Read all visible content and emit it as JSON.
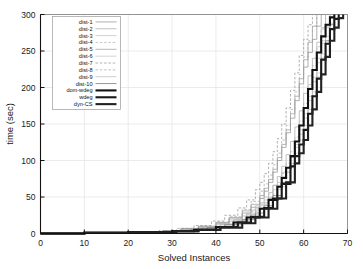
{
  "chart_data": {
    "type": "line",
    "title": "",
    "subtitle": "",
    "xlabel": "Solved Instances",
    "ylabel": "time (sec)",
    "xlim": [
      0,
      70
    ],
    "ylim": [
      0,
      300
    ],
    "xticks": [
      0,
      10,
      20,
      30,
      40,
      50,
      60,
      70
    ],
    "yticks": [
      0,
      50,
      100,
      150,
      200,
      250,
      300
    ],
    "grid": true,
    "legend_position": "upper-left-inside",
    "legend_entries": [
      {
        "label": "dist-1",
        "style": "solid",
        "width": 0.7,
        "color": "#8c8c8c"
      },
      {
        "label": "dist-2",
        "style": "solid",
        "width": 0.7,
        "color": "#a8a8a8"
      },
      {
        "label": "dist-3",
        "style": "solid",
        "width": 0.7,
        "color": "#bdbdbd"
      },
      {
        "label": "dist-4",
        "style": "dashed",
        "width": 0.7,
        "color": "#b0b0b0"
      },
      {
        "label": "dist-5",
        "style": "solid",
        "width": 0.7,
        "color": "#9a9a9a"
      },
      {
        "label": "dist-6",
        "style": "solid",
        "width": 0.7,
        "color": "#c2c2c2"
      },
      {
        "label": "dist-7",
        "style": "dashed",
        "width": 0.7,
        "color": "#8f8f8f"
      },
      {
        "label": "dist-8",
        "style": "dashed",
        "width": 0.7,
        "color": "#a5a5a5"
      },
      {
        "label": "dist-9",
        "style": "solid",
        "width": 0.7,
        "color": "#b8b8b8"
      },
      {
        "label": "dist-10",
        "style": "solid",
        "width": 0.8,
        "color": "#7d7d7d"
      },
      {
        "label": "dom-wdeg",
        "style": "solid",
        "width": 2.1,
        "color": "#111111"
      },
      {
        "label": "wdeg",
        "style": "solid",
        "width": 2.1,
        "color": "#1a1a1a"
      },
      {
        "label": "dyn-CS",
        "style": "solid",
        "width": 2.1,
        "color": "#222222"
      }
    ],
    "series": [
      {
        "name": "dist-1",
        "x": [
          0,
          10,
          20,
          28,
          32,
          36,
          40,
          43,
          46,
          48,
          50,
          51,
          52,
          53,
          54,
          55,
          56,
          57,
          58,
          59,
          60,
          61,
          62,
          63,
          64
        ],
        "y": [
          0,
          1,
          2,
          4,
          6,
          9,
          14,
          20,
          28,
          36,
          48,
          58,
          70,
          84,
          100,
          118,
          138,
          158,
          182,
          205,
          228,
          248,
          266,
          284,
          300
        ]
      },
      {
        "name": "dist-2",
        "x": [
          0,
          10,
          20,
          28,
          32,
          36,
          40,
          43,
          46,
          48,
          50,
          52,
          53,
          54,
          55,
          56,
          57,
          58,
          59,
          60,
          61,
          62,
          63,
          64,
          65
        ],
        "y": [
          0,
          1,
          2,
          4,
          6,
          8,
          12,
          17,
          24,
          32,
          42,
          56,
          66,
          78,
          92,
          108,
          126,
          146,
          168,
          192,
          216,
          240,
          262,
          282,
          300
        ]
      },
      {
        "name": "dist-3",
        "x": [
          0,
          10,
          20,
          28,
          33,
          37,
          41,
          44,
          47,
          49,
          51,
          53,
          55,
          56,
          57,
          58,
          59,
          60,
          61,
          62,
          63,
          64,
          65,
          66
        ],
        "y": [
          0,
          1,
          2,
          3,
          5,
          8,
          12,
          18,
          26,
          34,
          46,
          60,
          78,
          90,
          104,
          122,
          142,
          164,
          188,
          214,
          240,
          264,
          284,
          300
        ]
      },
      {
        "name": "dist-4",
        "x": [
          0,
          10,
          20,
          29,
          33,
          37,
          41,
          45,
          48,
          50,
          52,
          54,
          55,
          56,
          57,
          58,
          59,
          60,
          61,
          62,
          63,
          64,
          65
        ],
        "y": [
          0,
          1,
          2,
          4,
          6,
          9,
          14,
          21,
          30,
          40,
          54,
          70,
          82,
          96,
          112,
          132,
          154,
          178,
          204,
          230,
          256,
          280,
          300
        ]
      },
      {
        "name": "dist-5",
        "x": [
          0,
          10,
          20,
          28,
          32,
          36,
          40,
          43,
          46,
          48,
          50,
          51,
          52,
          53,
          54,
          55,
          56,
          57,
          58,
          59,
          60,
          61,
          62,
          63
        ],
        "y": [
          0,
          1,
          2,
          4,
          7,
          10,
          15,
          22,
          31,
          40,
          52,
          62,
          74,
          88,
          104,
          122,
          142,
          164,
          188,
          212,
          238,
          262,
          284,
          300
        ]
      },
      {
        "name": "dist-6",
        "x": [
          0,
          10,
          20,
          29,
          34,
          38,
          42,
          45,
          48,
          50,
          52,
          54,
          56,
          57,
          58,
          59,
          60,
          61,
          62,
          63,
          64,
          65,
          66,
          67
        ],
        "y": [
          0,
          1,
          2,
          3,
          5,
          8,
          12,
          18,
          26,
          35,
          48,
          64,
          84,
          96,
          110,
          128,
          148,
          170,
          194,
          220,
          246,
          270,
          288,
          300
        ]
      },
      {
        "name": "dist-7",
        "x": [
          0,
          10,
          20,
          27,
          31,
          35,
          39,
          42,
          45,
          47,
          49,
          50,
          51,
          52,
          53,
          54,
          55,
          56,
          57,
          58,
          59,
          60,
          61,
          62
        ],
        "y": [
          0,
          1,
          2,
          4,
          7,
          11,
          17,
          25,
          35,
          46,
          60,
          70,
          82,
          96,
          112,
          130,
          150,
          172,
          196,
          220,
          244,
          266,
          286,
          300
        ]
      },
      {
        "name": "dist-8",
        "x": [
          0,
          10,
          20,
          28,
          32,
          36,
          40,
          43,
          46,
          48,
          50,
          51,
          52,
          53,
          54,
          55,
          56,
          57,
          58,
          59,
          60,
          61,
          62,
          63
        ],
        "y": [
          0,
          1,
          2,
          4,
          6,
          10,
          16,
          23,
          33,
          44,
          58,
          68,
          80,
          94,
          110,
          128,
          148,
          170,
          194,
          218,
          242,
          264,
          284,
          300
        ]
      },
      {
        "name": "dist-9",
        "x": [
          0,
          10,
          20,
          29,
          33,
          37,
          41,
          44,
          47,
          49,
          51,
          53,
          55,
          57,
          58,
          59,
          60,
          61,
          62,
          63,
          64,
          65,
          66
        ],
        "y": [
          0,
          1,
          2,
          3,
          5,
          8,
          13,
          19,
          28,
          38,
          50,
          66,
          84,
          104,
          118,
          136,
          158,
          182,
          208,
          234,
          260,
          282,
          300
        ]
      },
      {
        "name": "dist-10",
        "x": [
          0,
          10,
          20,
          30,
          34,
          38,
          42,
          46,
          49,
          51,
          53,
          55,
          57,
          58,
          59,
          60,
          61,
          62,
          63,
          64,
          65,
          66,
          67
        ],
        "y": [
          0,
          1,
          2,
          3,
          5,
          8,
          12,
          19,
          28,
          38,
          52,
          70,
          92,
          106,
          122,
          142,
          164,
          188,
          214,
          240,
          264,
          286,
          300
        ]
      },
      {
        "name": "dom-wdeg",
        "x": [
          0,
          10,
          20,
          30,
          35,
          40,
          44,
          47,
          50,
          52,
          54,
          55,
          56,
          57,
          58,
          59,
          60,
          61,
          62,
          63,
          64,
          65,
          66,
          67
        ],
        "y": [
          0,
          1,
          2,
          3,
          5,
          9,
          15,
          22,
          34,
          46,
          64,
          76,
          90,
          106,
          126,
          148,
          172,
          198,
          224,
          248,
          270,
          286,
          296,
          300
        ]
      },
      {
        "name": "wdeg",
        "x": [
          0,
          10,
          20,
          30,
          36,
          41,
          45,
          48,
          51,
          53,
          55,
          57,
          58,
          59,
          60,
          61,
          62,
          63,
          64,
          65,
          66,
          67,
          68
        ],
        "y": [
          0,
          1,
          2,
          3,
          5,
          9,
          15,
          23,
          35,
          48,
          68,
          92,
          106,
          122,
          142,
          164,
          188,
          212,
          238,
          260,
          280,
          294,
          300
        ]
      },
      {
        "name": "dyn-CS",
        "x": [
          0,
          10,
          20,
          31,
          36,
          41,
          46,
          49,
          52,
          54,
          56,
          58,
          59,
          60,
          61,
          62,
          63,
          64,
          65,
          66,
          67,
          68,
          69
        ],
        "y": [
          0,
          1,
          2,
          3,
          5,
          8,
          14,
          22,
          34,
          48,
          70,
          96,
          110,
          128,
          148,
          170,
          194,
          218,
          242,
          264,
          282,
          295,
          300
        ]
      }
    ]
  }
}
